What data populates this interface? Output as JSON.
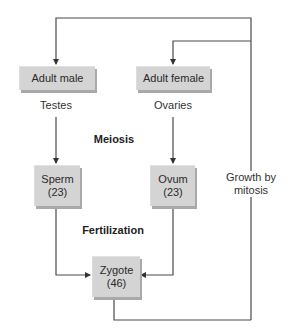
{
  "diagram": {
    "nodes": {
      "adult_male": {
        "label": "Adult male"
      },
      "adult_female": {
        "label": "Adult female"
      },
      "sperm": {
        "label": "Sperm",
        "count": "(23)"
      },
      "ovum": {
        "label": "Ovum",
        "count": "(23)"
      },
      "zygote": {
        "label": "Zygote",
        "count": "(46)"
      }
    },
    "labels": {
      "testes": "Testes",
      "ovaries": "Ovaries",
      "meiosis": "Meiosis",
      "fertilization": "Fertilization",
      "growth_line1": "Growth by",
      "growth_line2": "mitosis"
    },
    "edges": [
      {
        "from": "adult_male",
        "to": "sperm",
        "via": "Testes"
      },
      {
        "from": "adult_female",
        "to": "ovum",
        "via": "Ovaries"
      },
      {
        "from": "sperm",
        "to": "zygote"
      },
      {
        "from": "ovum",
        "to": "zygote"
      },
      {
        "from": "zygote",
        "to": "adult_male",
        "via": "Growth by mitosis"
      },
      {
        "from": "zygote",
        "to": "adult_female",
        "via": "Growth by mitosis"
      }
    ],
    "colors": {
      "box": "#d4d4d4",
      "box_shadow": "#a9a9a9",
      "line": "#4a4a4a"
    }
  }
}
